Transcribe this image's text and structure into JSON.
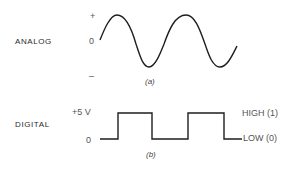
{
  "analog": {
    "label": "ANALOG",
    "ticks": {
      "plus": "+",
      "zero": "0",
      "minus": "–"
    },
    "caption": "(a)"
  },
  "digital": {
    "label": "DIGITAL",
    "ticks": {
      "high": "+5 V",
      "zero": "0"
    },
    "high_label": "HIGH (1)",
    "low_label": "LOW (0)",
    "caption": "(b)"
  },
  "colors": {
    "line": "#1e1e1e",
    "text": "#2a2a2a"
  }
}
